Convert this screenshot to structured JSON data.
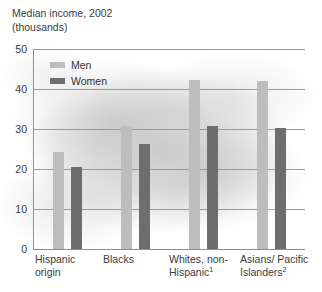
{
  "header": {
    "title": "Median income, 2002",
    "subtitle": "(thousands)"
  },
  "legend": {
    "position": "inside-top-left",
    "items": [
      {
        "label": "Men",
        "color": "#bdbdbd",
        "swatch_name": "legend-swatch-men"
      },
      {
        "label": "Women",
        "color": "#6e6e6e",
        "swatch_name": "legend-swatch-women"
      }
    ]
  },
  "axis": {
    "y_ticks": [
      "50",
      "40",
      "30",
      "20",
      "10",
      "0"
    ],
    "y_tick_values": [
      50,
      40,
      30,
      20,
      10,
      0
    ]
  },
  "categories": [
    {
      "line1": "Hispanic",
      "line2": "origin",
      "footnote": ""
    },
    {
      "line1": "Blacks",
      "line2": "",
      "footnote": ""
    },
    {
      "line1": "Whites, non-",
      "line2": "Hispanic",
      "footnote": "1"
    },
    {
      "line1": "Asians/ Pacific",
      "line2": "Islanders",
      "footnote": "2"
    }
  ],
  "chart_data": {
    "type": "bar",
    "title": "Median income, 2002 (thousands)",
    "xlabel": "",
    "ylabel": "thousands",
    "ylim": [
      0,
      50
    ],
    "ytick_step": 10,
    "grid": true,
    "legend_position": "inside-top-left",
    "categories": [
      "Hispanic origin",
      "Blacks",
      "Whites, non-Hispanic",
      "Asians/ Pacific Islanders"
    ],
    "series": [
      {
        "name": "Men",
        "color": "#bdbdbd",
        "values": [
          24.2,
          30.8,
          42.3,
          42.0
        ]
      },
      {
        "name": "Women",
        "color": "#6e6e6e",
        "values": [
          20.5,
          26.3,
          30.8,
          30.2
        ]
      }
    ],
    "footnotes": [
      "1",
      "2"
    ]
  },
  "colors": {
    "men_bar": "#bdbdbd",
    "women_bar": "#6e6e6e",
    "gridline": "#9a9a9a",
    "text": "#3b3b3b",
    "background": "#ffffff"
  }
}
